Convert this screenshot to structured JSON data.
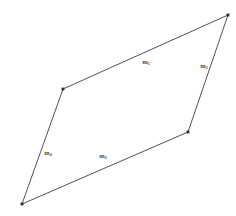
{
  "figure": {
    "type": "quadrilateral-diagram",
    "width": 236,
    "height": 216,
    "background_color": "#ffffff",
    "stroke_color": "#3c3c44",
    "stroke_width": 0.9,
    "vertex_marker_color": "#2b2b30",
    "label_color": "#4a4a4a",
    "vertices": [
      {
        "name": "top-right",
        "x": 228,
        "y": 15
      },
      {
        "name": "left",
        "x": 63,
        "y": 89
      },
      {
        "name": "bottom-left",
        "x": 22,
        "y": 204
      },
      {
        "name": "bottom-right",
        "x": 188,
        "y": 132
      }
    ],
    "edges": [
      {
        "id": "edge-top",
        "label_text": "m",
        "label_sub": "1",
        "from": "left",
        "to": "top-right",
        "label_x": 146,
        "label_y": 62
      },
      {
        "id": "edge-right",
        "label_text": "m",
        "label_sub": "2",
        "from": "top-right",
        "to": "bottom-right",
        "label_x": 204,
        "label_y": 66
      },
      {
        "id": "edge-bottom",
        "label_text": "m",
        "label_sub": "3",
        "from": "bottom-left",
        "to": "bottom-right",
        "label_x": 103,
        "label_y": 156
      },
      {
        "id": "edge-left",
        "label_text": "m",
        "label_sub": "4",
        "from": "bottom-left",
        "to": "left",
        "label_x": 48,
        "label_y": 153
      }
    ],
    "polygon_points": "228,15 63,89 22,204 188,132"
  }
}
